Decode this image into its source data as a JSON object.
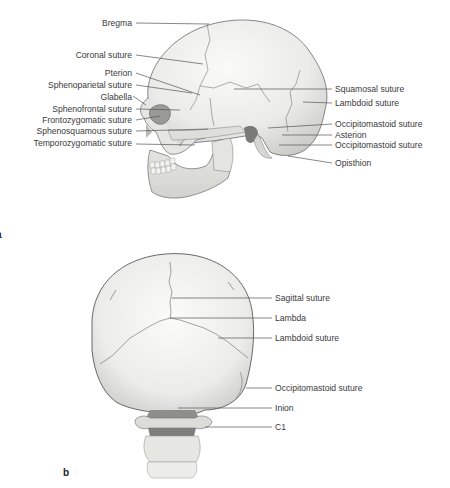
{
  "figure": {
    "panel_a": {
      "label": "a",
      "view": "lateral skull",
      "left_labels": [
        {
          "text": "Bregma"
        },
        {
          "text": "Coronal suture"
        },
        {
          "text": "Pterion"
        },
        {
          "text": "Sphenoparietal suture"
        },
        {
          "text": "Glabella"
        },
        {
          "text": "Sphenofrontal suture"
        },
        {
          "text": "Frontozygomatic suture"
        },
        {
          "text": "Sphenosquamous suture"
        },
        {
          "text": "Temporozygomatic suture"
        }
      ],
      "right_labels": [
        {
          "text": "Squamosal suture"
        },
        {
          "text": "Lambdoid suture"
        },
        {
          "text": "Occipitomastoid suture"
        },
        {
          "text": "Asterion"
        },
        {
          "text": "Occipitomastoid suture"
        },
        {
          "text": "Opisthion"
        }
      ]
    },
    "panel_b": {
      "label": "b",
      "view": "posterior skull",
      "right_labels": [
        {
          "text": "Sagittal suture"
        },
        {
          "text": "Lambda"
        },
        {
          "text": "Lambdoid suture"
        },
        {
          "text": "Occipitomastoid suture"
        },
        {
          "text": "Inion"
        },
        {
          "text": "C1"
        }
      ]
    },
    "colors": {
      "bone": "#eeeeec",
      "bone_shadow": "#c9c9c6",
      "outline": "#5a5a5a",
      "leader": "#555555",
      "text": "#3a3a3a"
    }
  }
}
